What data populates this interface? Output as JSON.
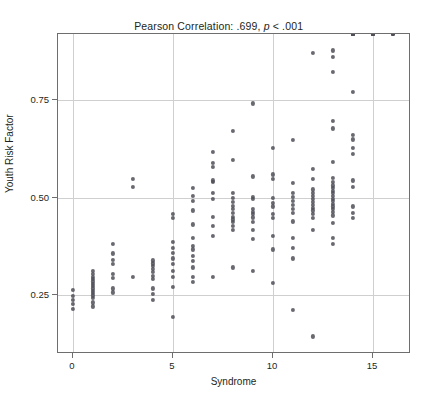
{
  "figure": {
    "background_color": "#ffffff",
    "point_color": "#4f4f58",
    "grid_color": "#cfcfcf",
    "frame_color": "#6e6e6e"
  },
  "title": {
    "prefix": "Pearson Correlation: .699, ",
    "italic": "p",
    "suffix": " < .001",
    "full": "Pearson Correlation: .699, p < .001"
  },
  "axes": {
    "x_label": "Syndrome",
    "y_label": "Youth Risk Factor",
    "x_ticks": [
      "0",
      "5",
      "10",
      "15"
    ],
    "x_tick_values": [
      0,
      5,
      10,
      15
    ],
    "y_ticks": [
      "0.25",
      "0.50",
      "0.75"
    ],
    "y_tick_values": [
      0.25,
      0.5,
      0.75
    ],
    "xlim": [
      -0.75,
      16.9
    ],
    "ylim": [
      0.1,
      0.92
    ],
    "grid": true
  },
  "chart_data": {
    "type": "scatter",
    "title": "Pearson Correlation: .699, p < .001",
    "xlabel": "Syndrome",
    "ylabel": "Youth Risk Factor",
    "xlim": [
      -0.75,
      16.9
    ],
    "ylim": [
      0.1,
      0.92
    ],
    "grid": true,
    "legend": null,
    "correlation_r": 0.699,
    "p_value": "< .001",
    "n_points": 213,
    "x": [
      0,
      0,
      0,
      0,
      0,
      1,
      1,
      1,
      1,
      1,
      1,
      1,
      1,
      1,
      1,
      1,
      1,
      1,
      1,
      2,
      2,
      2,
      2,
      2,
      2,
      2,
      2,
      3,
      3,
      3,
      4,
      4,
      4,
      4,
      4,
      4,
      4,
      4,
      4,
      4,
      5,
      5,
      5,
      5,
      5,
      5,
      5,
      5,
      5,
      5,
      5,
      6,
      6,
      6,
      6,
      6,
      6,
      6,
      6,
      6,
      6,
      6,
      6,
      6,
      7,
      7,
      7,
      7,
      7,
      7,
      7,
      7,
      7,
      7,
      7,
      8,
      8,
      8,
      8,
      8,
      8,
      8,
      8,
      8,
      8,
      8,
      8,
      8,
      8,
      9,
      9,
      9,
      9,
      9,
      9,
      9,
      9,
      9,
      9,
      9,
      9,
      10,
      10,
      10,
      10,
      10,
      10,
      10,
      10,
      10,
      10,
      10,
      11,
      11,
      11,
      11,
      11,
      11,
      11,
      11,
      11,
      11,
      11,
      11,
      11,
      12,
      12,
      12,
      12,
      12,
      12,
      12,
      12,
      12,
      12,
      12,
      12,
      12,
      12,
      12,
      13,
      13,
      13,
      13,
      13,
      13,
      13,
      13,
      13,
      13,
      13,
      13,
      13,
      13,
      13,
      13,
      13,
      13,
      13,
      13,
      13,
      13,
      13,
      14,
      14,
      14,
      14,
      14,
      14,
      14,
      14,
      14,
      14,
      14,
      14,
      14,
      14,
      14,
      14,
      14,
      14,
      14,
      14,
      15,
      15,
      15,
      15,
      15,
      15,
      15,
      15,
      15,
      16,
      16,
      16,
      16
    ],
    "y": [
      0.265,
      0.248,
      0.238,
      0.228,
      0.215,
      0.312,
      0.305,
      0.298,
      0.292,
      0.286,
      0.28,
      0.274,
      0.268,
      0.262,
      0.256,
      0.25,
      0.243,
      0.232,
      0.222,
      0.382,
      0.358,
      0.342,
      0.33,
      0.305,
      0.295,
      0.268,
      0.258,
      0.548,
      0.528,
      0.297,
      0.34,
      0.332,
      0.325,
      0.318,
      0.31,
      0.3,
      0.292,
      0.268,
      0.255,
      0.238,
      0.458,
      0.448,
      0.388,
      0.372,
      0.36,
      0.345,
      0.33,
      0.312,
      0.298,
      0.272,
      0.195,
      0.525,
      0.505,
      0.492,
      0.468,
      0.432,
      0.398,
      0.378,
      0.368,
      0.352,
      0.338,
      0.322,
      0.298,
      0.285,
      0.618,
      0.59,
      0.58,
      0.545,
      0.54,
      0.512,
      0.498,
      0.452,
      0.428,
      0.402,
      0.298,
      0.672,
      0.598,
      0.512,
      0.5,
      0.49,
      0.48,
      0.472,
      0.462,
      0.452,
      0.445,
      0.438,
      0.428,
      0.418,
      0.322,
      0.742,
      0.555,
      0.502,
      0.498,
      0.472,
      0.465,
      0.458,
      0.45,
      0.438,
      0.418,
      0.395,
      0.312,
      0.628,
      0.56,
      0.548,
      0.5,
      0.488,
      0.478,
      0.458,
      0.448,
      0.402,
      0.368,
      0.282,
      0.648,
      0.538,
      0.512,
      0.502,
      0.492,
      0.482,
      0.472,
      0.462,
      0.44,
      0.398,
      0.372,
      0.345,
      0.212,
      0.872,
      0.575,
      0.548,
      0.522,
      0.512,
      0.505,
      0.498,
      0.49,
      0.482,
      0.475,
      0.468,
      0.458,
      0.448,
      0.418,
      0.145,
      0.822,
      0.698,
      0.592,
      0.552,
      0.54,
      0.532,
      0.525,
      0.518,
      0.512,
      0.505,
      0.498,
      0.492,
      0.485,
      0.478,
      0.472,
      0.465,
      0.455,
      0.435,
      0.398,
      0.382,
      0.878,
      0.862,
      0.678,
      0.662,
      0.65,
      0.628,
      0.612,
      0.545,
      0.478,
      0.772,
      0.528,
      0.462,
      0.448
    ]
  }
}
